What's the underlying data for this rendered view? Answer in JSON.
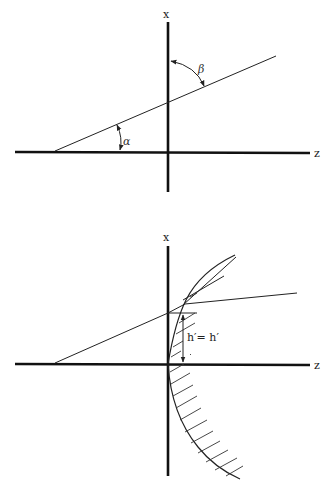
{
  "figures": [
    {
      "id": "top",
      "axes": {
        "vertical_label": "x",
        "horizontal_label": "z"
      },
      "angles": {
        "alpha": "α",
        "beta": "β"
      }
    },
    {
      "id": "bottom",
      "axes": {
        "vertical_label": "x",
        "horizontal_label": "z"
      },
      "height_label": "h′= h′"
    }
  ],
  "colors": {
    "ink": "#111111",
    "background": "#ffffff"
  }
}
